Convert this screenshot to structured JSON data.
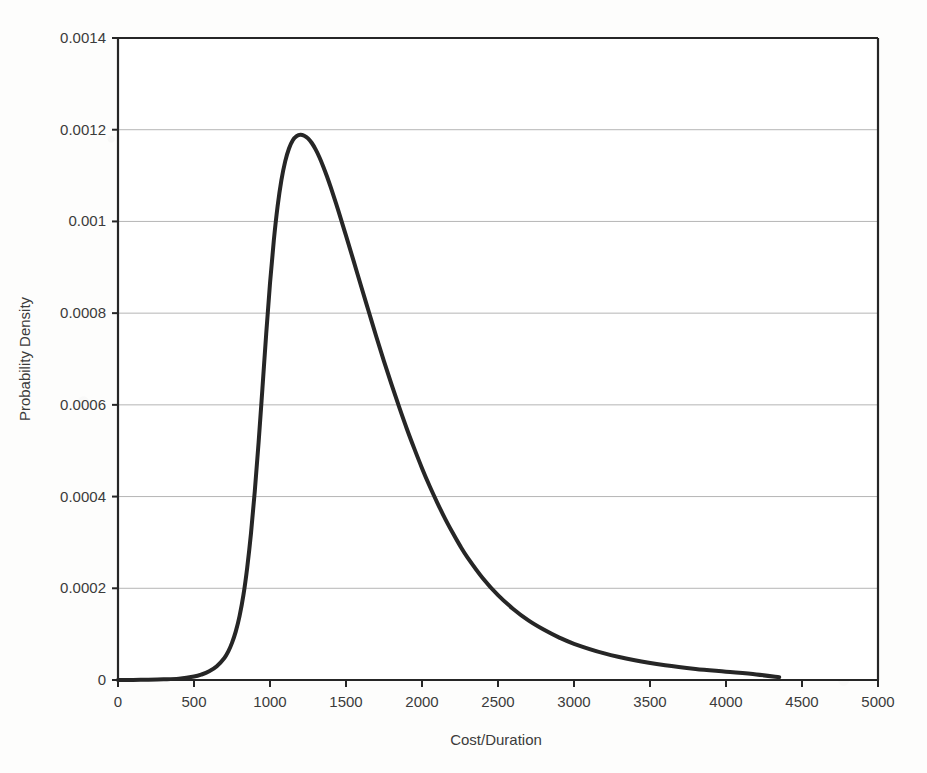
{
  "chart_data": {
    "type": "line",
    "title": "",
    "xlabel": "Cost/Duration",
    "ylabel": "Probability Density",
    "xlim": [
      0,
      5000
    ],
    "ylim": [
      0,
      0.0014
    ],
    "grid": true,
    "grid_axis": "y",
    "legend": "none",
    "line_color": "#262626",
    "line_width": 4,
    "axis_color": "#262626",
    "grid_color": "#b5b5b5",
    "background_color": "#fdfdfc",
    "x_ticks": [
      0,
      500,
      1000,
      1500,
      2000,
      2500,
      3000,
      3500,
      4000,
      4500,
      5000
    ],
    "x_tick_labels": [
      "0",
      "500",
      "1000",
      "1500",
      "2000",
      "2500",
      "3000",
      "3500",
      "4000",
      "4500",
      "5000"
    ],
    "y_ticks": [
      0,
      0.0002,
      0.0004,
      0.0006,
      0.0008,
      0.001,
      0.0012,
      0.0014
    ],
    "y_tick_labels": [
      "0",
      "0.0002",
      "0.0004",
      "0.0006",
      "0.0008",
      "0.001",
      "0.0012",
      "0.0014"
    ],
    "series": [
      {
        "name": "Probability Density",
        "x": [
          0,
          100,
          200,
          300,
          400,
          500,
          550,
          600,
          650,
          700,
          725,
          750,
          775,
          800,
          825,
          850,
          875,
          900,
          925,
          950,
          975,
          1000,
          1025,
          1050,
          1075,
          1100,
          1125,
          1150,
          1175,
          1200,
          1225,
          1250,
          1275,
          1300,
          1325,
          1350,
          1375,
          1400,
          1450,
          1500,
          1550,
          1600,
          1650,
          1700,
          1750,
          1800,
          1850,
          1900,
          1950,
          2000,
          2050,
          2100,
          2150,
          2200,
          2250,
          2300,
          2400,
          2500,
          2600,
          2700,
          2800,
          2900,
          3000,
          3200,
          3400,
          3600,
          3800,
          4000,
          4200,
          4350
        ],
        "y": [
          0.0,
          2e-07,
          6e-07,
          1.4e-06,
          3e-06,
          7.5e-06,
          1.2e-05,
          1.9e-05,
          3e-05,
          4.8e-05,
          6.2e-05,
          8.1e-05,
          0.000106,
          0.00014,
          0.000185,
          0.000245,
          0.00032,
          0.000412,
          0.000518,
          0.000635,
          0.000755,
          0.000865,
          0.000958,
          0.001033,
          0.00109,
          0.001131,
          0.001159,
          0.001177,
          0.001186,
          0.001189,
          0.001187,
          0.001181,
          0.001171,
          0.001157,
          0.00114,
          0.00112,
          0.001098,
          0.001074,
          0.001023,
          0.000969,
          0.000914,
          0.000858,
          0.000803,
          0.000748,
          0.000695,
          0.000644,
          0.000595,
          0.000548,
          0.000504,
          0.000462,
          0.000423,
          0.000387,
          0.000353,
          0.000322,
          0.000293,
          0.000267,
          0.000222,
          0.000185,
          0.000155,
          0.00013,
          0.00011,
          9.3e-05,
          7.9e-05,
          5.8e-05,
          4.3e-05,
          3.2e-05,
          2.4e-05,
          1.8e-05,
          1.2e-05,
          6e-06
        ]
      }
    ],
    "peak": {
      "x": 1240,
      "y": 0.00119
    }
  },
  "axis": {
    "x_title": "Cost/Duration",
    "y_title": "Probability Density"
  }
}
